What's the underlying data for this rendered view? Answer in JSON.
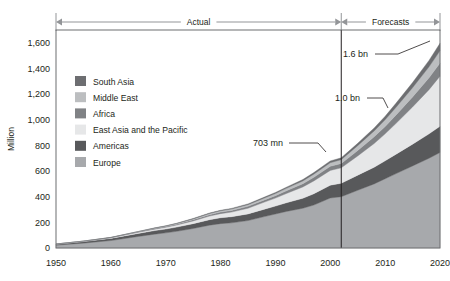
{
  "chart_data": {
    "type": "area",
    "stacked": true,
    "title": "",
    "xlabel": "",
    "ylabel": "Million",
    "xlim": [
      1950,
      2020
    ],
    "ylim": [
      0,
      1700
    ],
    "yticks": [
      0,
      200,
      400,
      600,
      800,
      1000,
      1200,
      1400,
      1600
    ],
    "ytick_labels": [
      "0",
      "200",
      "400",
      "600",
      "800",
      "1,000",
      "1,200",
      "1,400",
      "1,600"
    ],
    "xticks": [
      1950,
      1960,
      1970,
      1980,
      1990,
      2000,
      2010,
      2020
    ],
    "xtick_labels": [
      "1950",
      "1960",
      "1970",
      "1980",
      "1990",
      "2000",
      "2010",
      "2020"
    ],
    "grid": false,
    "legend_position": "upper-left-inside",
    "x": [
      1950,
      1955,
      1960,
      1965,
      1968,
      1970,
      1972,
      1975,
      1978,
      1980,
      1982,
      1985,
      1988,
      1990,
      1992,
      1995,
      1997,
      2000,
      2002,
      2005,
      2008,
      2010,
      2012,
      2015,
      2018,
      2020
    ],
    "series": [
      {
        "name": "Europe",
        "color": "#a7a9ac",
        "values": [
          22,
          38,
          58,
          90,
          108,
          118,
          130,
          152,
          178,
          190,
          196,
          214,
          245,
          265,
          285,
          310,
          335,
          390,
          400,
          450,
          500,
          540,
          580,
          640,
          700,
          745
        ]
      },
      {
        "name": "Americas",
        "color": "#58595b",
        "values": [
          7,
          12,
          17,
          24,
          28,
          30,
          33,
          38,
          43,
          46,
          48,
          52,
          58,
          62,
          68,
          78,
          88,
          100,
          105,
          118,
          130,
          140,
          152,
          170,
          190,
          205
        ]
      },
      {
        "name": "East Asia and the Pacific",
        "color": "#e6e7e8",
        "values": [
          1,
          2,
          4,
          8,
          11,
          13,
          16,
          21,
          28,
          32,
          36,
          44,
          55,
          62,
          72,
          88,
          100,
          115,
          120,
          150,
          185,
          210,
          240,
          290,
          345,
          390
        ]
      },
      {
        "name": "Africa",
        "color": "#808285",
        "values": [
          1,
          1,
          2,
          4,
          5,
          6,
          7,
          9,
          11,
          12,
          13,
          15,
          17,
          19,
          21,
          25,
          28,
          32,
          34,
          42,
          52,
          58,
          66,
          78,
          92,
          102
        ]
      },
      {
        "name": "Middle East",
        "color": "#bcbec0",
        "values": [
          0,
          1,
          1,
          2,
          3,
          4,
          5,
          7,
          9,
          10,
          11,
          13,
          15,
          17,
          19,
          22,
          25,
          28,
          30,
          38,
          46,
          52,
          60,
          72,
          86,
          96
        ]
      },
      {
        "name": "South Asia",
        "color": "#6d6e71",
        "values": [
          0,
          0,
          1,
          1,
          2,
          2,
          2,
          3,
          4,
          4,
          5,
          6,
          7,
          8,
          9,
          11,
          12,
          14,
          14,
          18,
          23,
          27,
          32,
          40,
          50,
          58
        ]
      }
    ],
    "annotations": [
      {
        "label": "703 mn",
        "x": 2002,
        "y": 703
      },
      {
        "label": "1.0 bn",
        "x": 2010,
        "y": 1027
      },
      {
        "label": "1.6 bn",
        "x": 2020,
        "y": 1596
      }
    ],
    "period_bands": [
      {
        "label": "Actual",
        "start": 1950,
        "end": 2002
      },
      {
        "label": "Forecasts",
        "start": 2002,
        "end": 2020
      }
    ],
    "divider_x": 2002
  },
  "legend": {
    "items": [
      {
        "label": "South Asia",
        "color": "#6d6e71"
      },
      {
        "label": "Middle East",
        "color": "#bcbec0"
      },
      {
        "label": "Africa",
        "color": "#808285"
      },
      {
        "label": "East Asia and the Pacific",
        "color": "#e6e7e8"
      },
      {
        "label": "Americas",
        "color": "#58595b"
      },
      {
        "label": "Europe",
        "color": "#a7a9ac"
      }
    ]
  }
}
